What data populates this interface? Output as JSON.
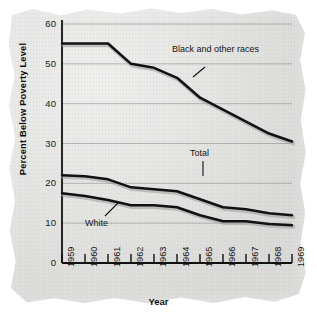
{
  "figure": {
    "x_axis_title": "Year",
    "y_axis_title": "Percent Below Poverty Level",
    "colors": {
      "paper": "#e2e2e0",
      "line": "#111111",
      "grid": "#8e8e8e",
      "axis": "#111111"
    }
  },
  "annotations": {
    "black": "Black and other races",
    "total": "Total",
    "white": "White"
  },
  "chart_data": {
    "type": "line",
    "title": "",
    "xlabel": "Year",
    "ylabel": "Percent Below Poverty Level",
    "x": [
      1959,
      1960,
      1961,
      1962,
      1963,
      1964,
      1965,
      1966,
      1967,
      1968,
      1969
    ],
    "categories": [
      "1959",
      "1960",
      "1961",
      "1962",
      "1963",
      "1964",
      "1965",
      "1966",
      "1967",
      "1968",
      "1969"
    ],
    "xlim": [
      1959,
      1969
    ],
    "ylim": [
      0,
      60
    ],
    "yticks": [
      0,
      10,
      20,
      30,
      40,
      50,
      60
    ],
    "xticks": [
      "1959",
      "1960",
      "1961",
      "1962",
      "1963",
      "1964",
      "1965",
      "1966",
      "1967",
      "1968",
      "1969"
    ],
    "grid": "horizontal",
    "legend": "inline-annotations",
    "series": [
      {
        "name": "Black and other races",
        "values": [
          55.1,
          55.1,
          55.1,
          50.0,
          49.0,
          46.5,
          41.5,
          38.5,
          35.5,
          32.5,
          30.5
        ]
      },
      {
        "name": "Total",
        "values": [
          22.0,
          21.8,
          21.0,
          19.0,
          18.5,
          18.0,
          16.0,
          14.0,
          13.5,
          12.5,
          12.0
        ]
      },
      {
        "name": "White",
        "values": [
          17.5,
          16.8,
          15.8,
          14.5,
          14.5,
          14.0,
          12.0,
          10.5,
          10.5,
          9.8,
          9.5
        ]
      }
    ]
  }
}
